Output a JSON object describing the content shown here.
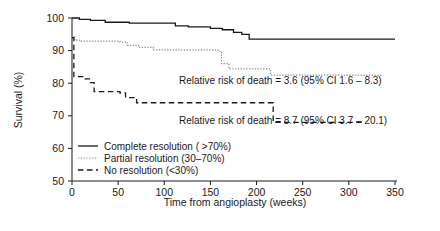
{
  "chart_data": {
    "type": "line",
    "title": "",
    "xlabel": "Time from angioplasty (weeks)",
    "ylabel": "Survival (%)",
    "xlim": [
      0,
      350
    ],
    "ylim": [
      50,
      100
    ],
    "xticks": [
      0,
      50,
      100,
      150,
      200,
      250,
      300,
      350
    ],
    "yticks": [
      50,
      60,
      70,
      80,
      90,
      100
    ],
    "grid": false,
    "legend_position": "bottom-left",
    "series": [
      {
        "name": "Complete resolution ( >70%)",
        "style": "solid",
        "color": "#1a1a1a",
        "points": [
          [
            0,
            100
          ],
          [
            8,
            100
          ],
          [
            8,
            99.6
          ],
          [
            20,
            99.6
          ],
          [
            20,
            99.3
          ],
          [
            36,
            99.3
          ],
          [
            36,
            98.7
          ],
          [
            62,
            98.7
          ],
          [
            62,
            98.4
          ],
          [
            112,
            98.4
          ],
          [
            112,
            97.6
          ],
          [
            126,
            97.6
          ],
          [
            126,
            97.3
          ],
          [
            150,
            97.3
          ],
          [
            150,
            96.8
          ],
          [
            163,
            96.8
          ],
          [
            163,
            96.4
          ],
          [
            175,
            96.4
          ],
          [
            175,
            95.6
          ],
          [
            184,
            95.6
          ],
          [
            184,
            95.0
          ],
          [
            192,
            95.0
          ],
          [
            192,
            93.5
          ],
          [
            350,
            93.5
          ]
        ]
      },
      {
        "name": "Partial resolution (30–70%)",
        "style": "dotted",
        "color": "#8a8a8a",
        "points": [
          [
            0,
            94.5
          ],
          [
            3,
            94.5
          ],
          [
            3,
            93.2
          ],
          [
            10,
            93.2
          ],
          [
            10,
            92.9
          ],
          [
            52,
            92.9
          ],
          [
            52,
            92.6
          ],
          [
            60,
            92.6
          ],
          [
            60,
            91.6
          ],
          [
            72,
            91.6
          ],
          [
            72,
            91.0
          ],
          [
            88,
            91.0
          ],
          [
            88,
            90.2
          ],
          [
            158,
            90.2
          ],
          [
            158,
            89.8
          ],
          [
            162,
            89.8
          ],
          [
            162,
            86.0
          ],
          [
            170,
            86.0
          ],
          [
            170,
            84.4
          ],
          [
            215,
            84.4
          ],
          [
            215,
            82.5
          ],
          [
            335,
            82.5
          ]
        ]
      },
      {
        "name": "No resolution (<30%)",
        "style": "dashed",
        "color": "#1a1a1a",
        "points": [
          [
            0,
            94.0
          ],
          [
            2,
            94.0
          ],
          [
            2,
            82.0
          ],
          [
            14,
            82.0
          ],
          [
            14,
            81.3
          ],
          [
            20,
            81.3
          ],
          [
            20,
            80.2
          ],
          [
            24,
            80.2
          ],
          [
            24,
            77.4
          ],
          [
            52,
            77.4
          ],
          [
            52,
            77.0
          ],
          [
            58,
            77.0
          ],
          [
            58,
            75.6
          ],
          [
            70,
            75.6
          ],
          [
            70,
            74.0
          ],
          [
            218,
            74.0
          ],
          [
            218,
            68.0
          ],
          [
            318,
            68.0
          ]
        ]
      }
    ],
    "annotations": [
      {
        "text": "Relative risk of death = 3.6 (95% CI 1.6 – 8.3)",
        "x": 180,
        "y": 78.5
      },
      {
        "text": "Relative risk of death = 8.7 (95% CI 3.7 – 20.1)",
        "x": 180,
        "y": 63.5
      }
    ]
  },
  "axes": {
    "ylabel": "Survival (%)",
    "xlabel": "Time from angioplasty (weeks)",
    "ytick_labels": [
      "100",
      "90",
      "80",
      "70",
      "60",
      "50"
    ],
    "xtick_labels": [
      "0",
      "50",
      "100",
      "150",
      "200",
      "250",
      "300",
      "350"
    ]
  },
  "annotations": {
    "risk_partial": "Relative risk of death = 3.6 (95% CI 1.6 – 8.3)",
    "risk_none": "Relative risk of death = 8.7 (95% CI 3.7 – 20.1)"
  },
  "legend": {
    "items": [
      {
        "label": "Complete resolution ( >70%)",
        "style": "solid"
      },
      {
        "label": "Partial resolution (30–70%)",
        "style": "dotted"
      },
      {
        "label": "No resolution (<30%)",
        "style": "dashed"
      }
    ]
  },
  "colors": {
    "ink": "#1a1a1a",
    "grey": "#8a8a8a",
    "background": "#ffffff"
  }
}
